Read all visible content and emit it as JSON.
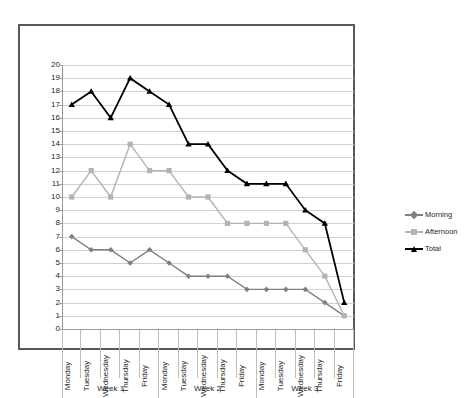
{
  "chart_data": {
    "type": "line",
    "title": "",
    "xlabel": "",
    "ylabel": "",
    "ylim": [
      0,
      20
    ],
    "ytick_step": 1,
    "grid": true,
    "legend_position": "right",
    "categories": [
      "Monday",
      "Tuesday",
      "Wednesday",
      "Thursday",
      "Friday",
      "Monday",
      "Tuesday",
      "Wednesday",
      "Thursday",
      "Friday",
      "Monday",
      "Tuesday",
      "Wednesday",
      "Thursday",
      "Friday"
    ],
    "group_labels": [
      "Week 1",
      "Week 2",
      "Week 3"
    ],
    "group_sizes": [
      5,
      5,
      5
    ],
    "ytick_labels": [
      "20",
      "19",
      "18",
      "17",
      "16",
      "15",
      "14",
      "13",
      "12",
      "11",
      "10",
      "9",
      "8",
      "7",
      "6",
      "5",
      "4",
      "3",
      "2",
      "1",
      "0"
    ],
    "series": [
      {
        "name": "Morning",
        "color": "#808080",
        "marker": "diamond",
        "values": [
          7,
          6,
          6,
          5,
          6,
          5,
          4,
          4,
          4,
          3,
          3,
          3,
          3,
          2,
          1
        ]
      },
      {
        "name": "Afternoon",
        "color": "#b3b3b3",
        "marker": "square",
        "values": [
          10,
          12,
          10,
          14,
          12,
          12,
          10,
          10,
          8,
          8,
          8,
          8,
          6,
          4,
          1
        ]
      },
      {
        "name": "Total",
        "color": "#000000",
        "marker": "triangle",
        "values": [
          17,
          18,
          16,
          19,
          18,
          17,
          14,
          14,
          12,
          11,
          11,
          11,
          9,
          8,
          2
        ]
      }
    ]
  },
  "legend": {
    "items": [
      {
        "label": "Morning"
      },
      {
        "label": "Afternoon"
      },
      {
        "label": "Total"
      }
    ]
  },
  "colors": {
    "morning": "#808080",
    "afternoon": "#b3b3b3",
    "total": "#000000",
    "gridline": "#d0d0d0",
    "frame": "#595959",
    "axis": "#9a9a9a",
    "text": "#262626",
    "background": "#ffffff"
  }
}
